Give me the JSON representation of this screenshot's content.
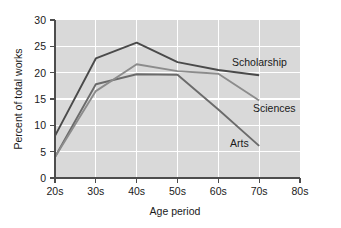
{
  "chart_data": {
    "type": "line",
    "title": "",
    "subtitle": "",
    "xlabel": "Age period",
    "ylabel": "Percent of total works",
    "categories": [
      "20s",
      "30s",
      "40s",
      "50s",
      "60s",
      "70s",
      "80s"
    ],
    "x_tick_labels": [
      "20s",
      "30s",
      "40s",
      "50s",
      "60s",
      "70s",
      "80s"
    ],
    "y_tick_labels": [
      "0",
      "5",
      "10",
      "15",
      "20",
      "25",
      "30"
    ],
    "xlim": [
      20,
      80
    ],
    "ylim": [
      0,
      30
    ],
    "y_tick_step": 5,
    "grid": true,
    "grid_axis": "both",
    "grid_color": "#ffffff",
    "plot_background": "#d9d9d9",
    "legend_position": "inline-right-labels",
    "series": [
      {
        "name": "Scholarship",
        "color": "#4a4a4a",
        "x": [
          "20s",
          "30s",
          "40s",
          "50s",
          "60s",
          "70s"
        ],
        "values": [
          8.0,
          22.7,
          25.7,
          22.0,
          20.5,
          19.5
        ],
        "label_text": "Scholarship"
      },
      {
        "name": "Sciences",
        "color": "#8c8c8c",
        "x": [
          "20s",
          "30s",
          "40s",
          "50s",
          "60s",
          "70s"
        ],
        "values": [
          4.0,
          16.5,
          21.6,
          20.3,
          19.8,
          14.7
        ],
        "label_text": "Sciences"
      },
      {
        "name": "Arts",
        "color": "#6b6b6b",
        "x": [
          "20s",
          "30s",
          "40s",
          "50s",
          "60s",
          "70s"
        ],
        "values": [
          4.0,
          17.8,
          19.7,
          19.6,
          13.0,
          6.1
        ],
        "label_text": "Arts"
      }
    ],
    "annotations": [
      {
        "text": "Scholarship",
        "x": "60s",
        "y": 22.4
      },
      {
        "text": "Sciences",
        "x": "70s",
        "y": 13.2
      },
      {
        "text": "Arts",
        "x": "65s",
        "y": 6.6
      }
    ]
  },
  "axis": {
    "x_title": "Age period",
    "y_title": "Percent of total works",
    "x_ticks": [
      "20s",
      "30s",
      "40s",
      "50s",
      "60s",
      "70s",
      "80s"
    ],
    "y_ticks": [
      "30",
      "25",
      "20",
      "15",
      "10",
      "5",
      "0"
    ]
  },
  "labels": {
    "scholarship": "Scholarship",
    "sciences": "Sciences",
    "arts": "Arts"
  }
}
